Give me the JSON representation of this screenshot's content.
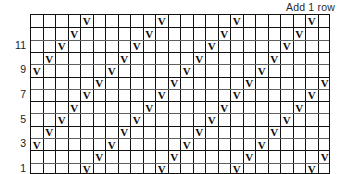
{
  "caption": "Add 1 row",
  "chart_data": {
    "type": "table",
    "title": "Add 1 row",
    "columns": 24,
    "rows": 13,
    "symbol": "V",
    "row_numbers_shown": [
      "1",
      "3",
      "5",
      "7",
      "9",
      "11"
    ],
    "grid": true,
    "colors": {
      "grid_line": "#111111",
      "minor_line": "#5f5f5f",
      "background": "#ffffff",
      "symbol": "#0d0d0d"
    },
    "row_labels": [
      {
        "row": 13,
        "label": ""
      },
      {
        "row": 12,
        "label": ""
      },
      {
        "row": 11,
        "label": "11"
      },
      {
        "row": 10,
        "label": ""
      },
      {
        "row": 9,
        "label": "9"
      },
      {
        "row": 8,
        "label": ""
      },
      {
        "row": 7,
        "label": "7"
      },
      {
        "row": 6,
        "label": ""
      },
      {
        "row": 5,
        "label": "5"
      },
      {
        "row": 4,
        "label": ""
      },
      {
        "row": 3,
        "label": "3"
      },
      {
        "row": 2,
        "label": ""
      },
      {
        "row": 1,
        "label": "1"
      }
    ],
    "rows_data": [
      {
        "row": 13,
        "marks": [
          4,
          10,
          16,
          22
        ]
      },
      {
        "row": 12,
        "marks": [
          3,
          9,
          15,
          21
        ]
      },
      {
        "row": 11,
        "marks": [
          2,
          8,
          14,
          20
        ]
      },
      {
        "row": 10,
        "marks": [
          1,
          7,
          13,
          19
        ]
      },
      {
        "row": 9,
        "marks": [
          0,
          6,
          12,
          18
        ]
      },
      {
        "row": 8,
        "marks": [
          5,
          11,
          17,
          23
        ]
      },
      {
        "row": 7,
        "marks": [
          4,
          10,
          16,
          22
        ]
      },
      {
        "row": 6,
        "marks": [
          3,
          9,
          15,
          21
        ]
      },
      {
        "row": 5,
        "marks": [
          2,
          8,
          14,
          20
        ]
      },
      {
        "row": 4,
        "marks": [
          1,
          7,
          13,
          19
        ]
      },
      {
        "row": 3,
        "marks": [
          0,
          6,
          12,
          18
        ]
      },
      {
        "row": 2,
        "marks": [
          5,
          11,
          17,
          23
        ]
      },
      {
        "row": 1,
        "marks": [
          4,
          10,
          16,
          22
        ]
      }
    ],
    "row_borders": [
      {
        "row": 13,
        "style": "none"
      },
      {
        "row": 12,
        "style": "thick"
      },
      {
        "row": 11,
        "style": "thin"
      },
      {
        "row": 10,
        "style": "thick"
      },
      {
        "row": 9,
        "style": "thin"
      },
      {
        "row": 8,
        "style": "thick"
      },
      {
        "row": 7,
        "style": "thin"
      },
      {
        "row": 6,
        "style": "thick"
      },
      {
        "row": 5,
        "style": "thin"
      },
      {
        "row": 4,
        "style": "thick"
      },
      {
        "row": 3,
        "style": "thin"
      },
      {
        "row": 2,
        "style": "thick"
      },
      {
        "row": 1,
        "style": "thin"
      }
    ]
  }
}
